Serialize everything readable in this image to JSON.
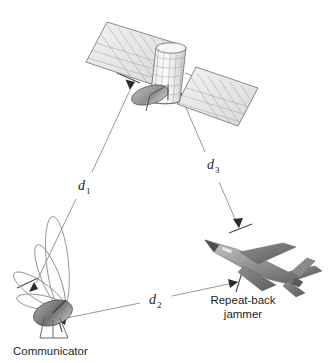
{
  "diagram": {
    "background_color": "#ffffff",
    "line_color": "#8b8b8b",
    "text_color": "#231f20",
    "nodes": [
      {
        "id": "satellite",
        "name": "satellite",
        "label": "",
        "position": {
          "x": 168,
          "y": 62
        }
      },
      {
        "id": "communicator",
        "name": "communicator",
        "label": "Communicator",
        "position": {
          "x": 58,
          "y": 305
        }
      },
      {
        "id": "jammer",
        "name": "repeat-back-jammer",
        "label_line1": "Repeat-back",
        "label_line2": "jammer",
        "position": {
          "x": 262,
          "y": 258
        }
      }
    ],
    "links": [
      {
        "id": "d1",
        "symbol": "d",
        "subscript": "1",
        "from": "communicator",
        "to": "satellite",
        "label_position": {
          "x": 82,
          "y": 186
        }
      },
      {
        "id": "d2",
        "symbol": "d",
        "subscript": "2",
        "from": "communicator",
        "to": "jammer",
        "label_position": {
          "x": 155,
          "y": 300
        }
      },
      {
        "id": "d3",
        "symbol": "d",
        "subscript": "3",
        "from": "satellite",
        "to": "jammer",
        "label_position": {
          "x": 213,
          "y": 165
        }
      }
    ]
  },
  "labels": {
    "communicator": "Communicator",
    "jammer_line1": "Repeat-back",
    "jammer_line2": "jammer",
    "d1_symbol": "d",
    "d1_sub": "1",
    "d2_symbol": "d",
    "d2_sub": "2",
    "d3_symbol": "d",
    "d3_sub": "3"
  }
}
